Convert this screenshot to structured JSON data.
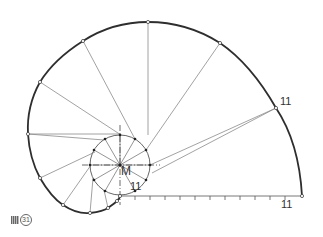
{
  "figure": {
    "caption_prefix": "図",
    "caption_number": "31",
    "labels": {
      "center": "M",
      "end_label_arc": "11",
      "end_label_circle": "11",
      "end_label_baseline": "11"
    }
  },
  "geometry": {
    "center": [
      120,
      165
    ],
    "circle_radius": 30,
    "baseline": {
      "from": [
        120,
        196
      ],
      "to": [
        302,
        196
      ],
      "tick_count": 11
    },
    "spiral_points": [
      [
        302,
        196
      ],
      [
        276,
        108
      ],
      [
        220,
        43
      ],
      [
        148,
        22
      ],
      [
        83,
        41
      ],
      [
        40,
        82
      ],
      [
        28,
        134
      ],
      [
        40,
        178
      ],
      [
        63,
        205
      ],
      [
        90,
        213
      ],
      [
        108,
        208
      ],
      [
        117,
        201
      ],
      [
        120,
        196
      ]
    ]
  },
  "colors": {
    "spiral": "#333333",
    "construction": "#888888",
    "dashdot": "#444444",
    "background": "#ffffff"
  }
}
